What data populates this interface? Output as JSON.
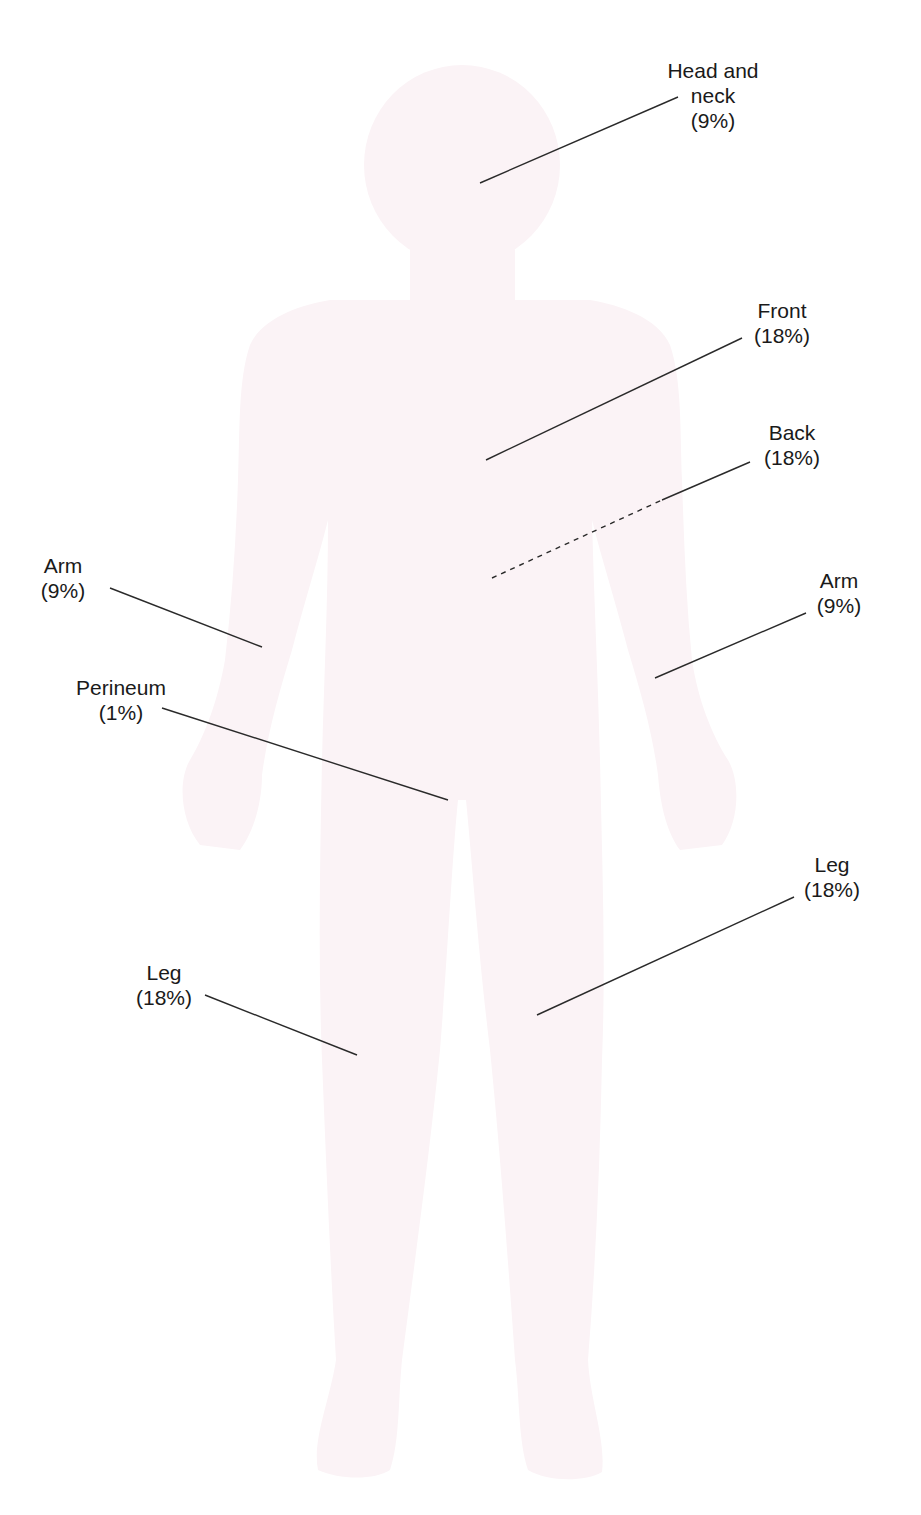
{
  "figure": {
    "silhouette_color": "#fbf3f6",
    "line_color": "#2a2a2a"
  },
  "labels": {
    "head_neck": {
      "line1": "Head and",
      "line2": "neck",
      "percent": "(9%)"
    },
    "front": {
      "name": "Front",
      "percent": "(18%)"
    },
    "back": {
      "name": "Back",
      "percent": "(18%)"
    },
    "arm_left": {
      "name": "Arm",
      "percent": "(9%)"
    },
    "arm_right": {
      "name": "Arm",
      "percent": "(9%)"
    },
    "perineum": {
      "name": "Perineum",
      "percent": "(1%)"
    },
    "leg_left": {
      "name": "Leg",
      "percent": "(18%)"
    },
    "leg_right": {
      "name": "Leg",
      "percent": "(18%)"
    }
  }
}
